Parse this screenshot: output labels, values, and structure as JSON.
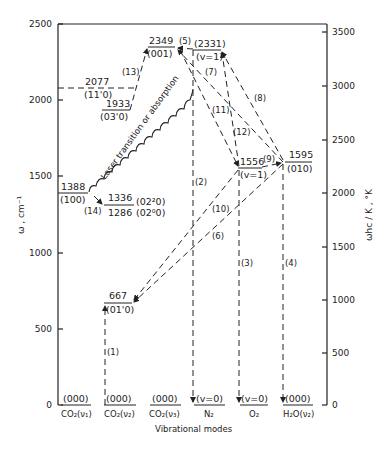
{
  "diagram": {
    "type": "energy-level diagram",
    "left_axis": {
      "label": "ω , cm⁻¹",
      "ticks": [
        "0",
        "500",
        "1000",
        "1500",
        "2000",
        "2500"
      ]
    },
    "right_axis": {
      "label": "ωhc / K , °K",
      "ticks": [
        "0",
        "500",
        "1000",
        "1500",
        "2000",
        "2500",
        "3000",
        "3500"
      ]
    },
    "x_axis_label": "Vibrational modes",
    "modes": [
      {
        "name": "CO₂(ν₁)",
        "ground": "(000)"
      },
      {
        "name": "CO₂(ν₂)",
        "ground": "(000)"
      },
      {
        "name": "CO₂(ν₃)",
        "ground": "(000)"
      },
      {
        "name": "N₂",
        "ground": "(v=0)"
      },
      {
        "name": "O₂",
        "ground": "(v=0)"
      },
      {
        "name": "H₂O(ν₂)",
        "ground": "(000)"
      }
    ],
    "levels": [
      {
        "energy": "2349",
        "state": "(001)"
      },
      {
        "energy": "(2331)",
        "state": "(v=1)"
      },
      {
        "energy": "2077",
        "state": "(11'0)"
      },
      {
        "energy": "1933",
        "state": "(03'0)"
      },
      {
        "energy": "1388",
        "state": "(100)"
      },
      {
        "energy": "1336",
        "state": "(02²0)"
      },
      {
        "energy": "1286",
        "state": "(02⁰0)"
      },
      {
        "energy": "1556",
        "state": "(v=1)"
      },
      {
        "energy": "1595",
        "state": "(010)"
      },
      {
        "energy": "667",
        "state": "(01'0)"
      }
    ],
    "transitions": [
      "(1)",
      "(2)",
      "(3)",
      "(4)",
      "(5)",
      "(6)",
      "(7)",
      "(8)",
      "(9)",
      "(10)",
      "(11)",
      "(12)",
      "(13)",
      "(14)"
    ],
    "annotation": "Laser transition or absorption"
  }
}
